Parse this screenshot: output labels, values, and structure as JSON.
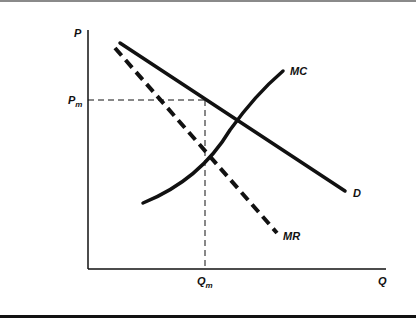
{
  "diagram": {
    "type": "monopoly-pricing",
    "axes": {
      "y_label": "P",
      "x_label": "Q"
    },
    "markers": {
      "price": {
        "main": "P",
        "sub": "m"
      },
      "quantity": {
        "main": "Q",
        "sub": "m"
      }
    },
    "curves": [
      {
        "id": "D",
        "label": "D",
        "style": "solid",
        "description": "Demand"
      },
      {
        "id": "MR",
        "label": "MR",
        "style": "dashed",
        "description": "Marginal revenue"
      },
      {
        "id": "MC",
        "label": "MC",
        "style": "solid-curved",
        "description": "Marginal cost"
      }
    ],
    "colors": {
      "line": "#111111",
      "background": "#ffffff",
      "top_border": "#8a8a8a"
    }
  }
}
